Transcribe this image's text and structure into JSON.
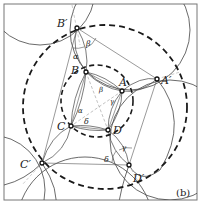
{
  "figure": {
    "panel_label": "(b)",
    "points": {
      "A": "A",
      "B": "B",
      "C": "C",
      "D": "D",
      "A_prime": "A′",
      "B_prime": "B′",
      "C_prime": "C′",
      "D_prime": "D′"
    },
    "angles": {
      "alpha": "α",
      "beta": "β",
      "gamma": "γ",
      "delta": "δ"
    },
    "colors": {
      "stroke": "#333333",
      "dashed": "#1a1a1a",
      "thin": "#555555",
      "frame": "#777777",
      "background": "#ffffff"
    }
  }
}
